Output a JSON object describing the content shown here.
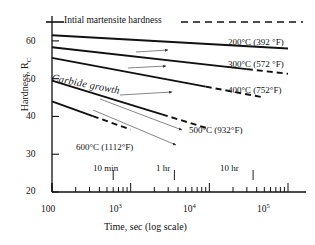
{
  "chart_data": {
    "type": "line",
    "title": "",
    "xlabel": "Time, sec (log scale)",
    "ylabel": "Hardness, R_C",
    "ylabel_main": "Hardness, R",
    "ylabel_sub": "C",
    "xscale": "log",
    "xlim": [
      100,
      100000
    ],
    "ylim": [
      20,
      65
    ],
    "yticks": [
      20,
      30,
      40,
      50,
      60
    ],
    "ytick_labels": [
      "20",
      "30",
      "40",
      "50",
      "60"
    ],
    "xticks": [
      100,
      1000,
      10000,
      100000
    ],
    "xtick_labels": [
      "100",
      "10³",
      "10⁴",
      "10⁵"
    ],
    "xtick_label_parts": [
      {
        "base": "100",
        "exp": ""
      },
      {
        "base": "10",
        "exp": "3"
      },
      {
        "base": "10",
        "exp": "4"
      },
      {
        "base": "10",
        "exp": "5"
      }
    ],
    "grid": false,
    "legend": "inline-right-labels",
    "reference_line": {
      "label": "Intial martensite hardness",
      "value": 65,
      "style": "dashed"
    },
    "annotations": [
      {
        "label": "Carbide growth",
        "style": "italic-rotated"
      },
      {
        "label": "10 min",
        "x": 600
      },
      {
        "label": "1 hr",
        "x": 3600
      },
      {
        "label": "10 hr",
        "x": 36000
      }
    ],
    "series": [
      {
        "name": "200°C (392 °F)",
        "temp_c": 200,
        "temp_f": 392,
        "points": [
          [
            100,
            61.5
          ],
          [
            100000,
            58.0
          ]
        ],
        "dash_from": null
      },
      {
        "name": "300°C (572 °F)",
        "temp_c": 300,
        "temp_f": 572,
        "points": [
          [
            100,
            58.3
          ],
          [
            100000,
            51.3
          ]
        ],
        "dash_from": 30000
      },
      {
        "name": "400°C (752°F)",
        "temp_c": 400,
        "temp_f": 752,
        "points": [
          [
            100,
            55.5
          ],
          [
            50000,
            45.0
          ]
        ],
        "dash_from": 9000
      },
      {
        "name": "500°C (932°F)",
        "temp_c": 500,
        "temp_f": 932,
        "points": [
          [
            100,
            49.5
          ],
          [
            9000,
            37.0
          ]
        ],
        "dash_from": 2500
      },
      {
        "name": "600°C (1112°F)",
        "temp_c": 600,
        "temp_f": 1112,
        "points": [
          [
            100,
            44.0
          ],
          [
            1000,
            36.5
          ]
        ],
        "dash_from": 330
      }
    ],
    "growth_arrows": 5
  },
  "axes": {
    "y_title_main": "Hardness, R",
    "y_title_sub": "C",
    "x_title": "Time, sec (log scale)"
  },
  "ticks": {
    "y": [
      "60",
      "50",
      "40",
      "30",
      "20"
    ],
    "x": [
      "100",
      "10",
      "10",
      "10"
    ],
    "x_exp": [
      "",
      "3",
      "4",
      "5"
    ]
  },
  "labels": {
    "reference": "Intial martensite hardness",
    "carbide": "Carbide growth",
    "s200": "200°C (392 °F)",
    "s300": "300°C (572 °F)",
    "s400": "400°C (752°F)",
    "s500": "500°C (932°F)",
    "s600": "600°C (1112°F)",
    "t10min": "10 min",
    "t1hr": "1 hr",
    "t10hr": "10 hr"
  }
}
